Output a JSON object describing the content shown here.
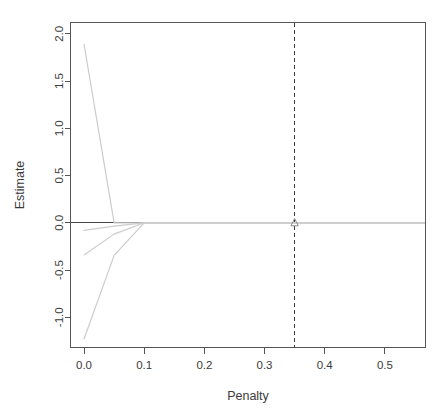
{
  "chart_data": {
    "type": "line",
    "title": "",
    "xlabel": "Penalty",
    "ylabel": "Estimate",
    "xlim": [
      -0.0225,
      0.5675
    ],
    "ylim": [
      -1.32,
      2.12
    ],
    "xticks": [
      0.0,
      0.1,
      0.2,
      0.3,
      0.4,
      0.5
    ],
    "xtick_labels": [
      "0.0",
      "0.1",
      "0.2",
      "0.3",
      "0.4",
      "0.5"
    ],
    "yticks": [
      -1.0,
      -0.5,
      0.0,
      0.5,
      1.0,
      1.5,
      2.0
    ],
    "ytick_labels": [
      "-1.0",
      "-0.5",
      "0.0",
      "0.5",
      "1.0",
      "1.5",
      "2.0"
    ],
    "grid": false,
    "legend": "none",
    "line_color": "#cccccc",
    "reference_line_color": "#444444",
    "marker_color": "#8a8a8a",
    "series": [
      {
        "name": "coef-1",
        "x": [
          0.0,
          0.05,
          0.1,
          0.2,
          0.3,
          0.35,
          0.4,
          0.5,
          0.5675
        ],
        "values": [
          1.89,
          0.0,
          0.0,
          0.0,
          0.0,
          0.0,
          0.0,
          0.0,
          0.0
        ]
      },
      {
        "name": "coef-2",
        "x": [
          0.0,
          0.05,
          0.1,
          0.2,
          0.3,
          0.35,
          0.4,
          0.5,
          0.5675
        ],
        "values": [
          -0.08,
          -0.035,
          0.0,
          0.0,
          0.0,
          0.0,
          0.0,
          0.0,
          0.0
        ]
      },
      {
        "name": "coef-3",
        "x": [
          0.0,
          0.05,
          0.1,
          0.2,
          0.3,
          0.35,
          0.4,
          0.5,
          0.5675
        ],
        "values": [
          -0.34,
          -0.12,
          0.0,
          0.0,
          0.0,
          0.0,
          0.0,
          0.0,
          0.0
        ]
      },
      {
        "name": "coef-4",
        "x": [
          0.0,
          0.05,
          0.1,
          0.2,
          0.3,
          0.35,
          0.4,
          0.5,
          0.5675
        ],
        "values": [
          -1.23,
          -0.345,
          0.0,
          0.0,
          0.0,
          0.0,
          0.0,
          0.0,
          0.0
        ]
      }
    ],
    "reference_lines": [
      {
        "name": "zero-estimate-line",
        "orientation": "horizontal",
        "value": 0.0
      },
      {
        "name": "selected-penalty-line",
        "orientation": "vertical",
        "value": 0.35,
        "style": "dashed"
      }
    ],
    "markers": [
      {
        "name": "selected-penalty-marker",
        "shape": "triangle",
        "x": 0.35,
        "y": 0.0
      }
    ]
  }
}
